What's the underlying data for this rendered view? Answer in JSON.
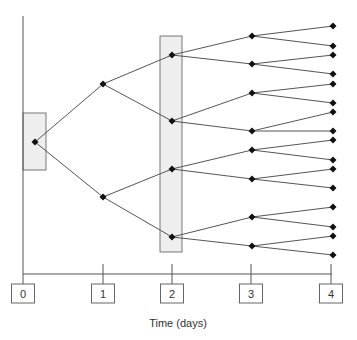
{
  "diagram": {
    "type": "binary-tree-over-time",
    "axis": {
      "xlabel": "Time (days)",
      "ticks": [
        "0",
        "1",
        "2",
        "3",
        "4"
      ]
    },
    "highlighted_stages": [
      0,
      2
    ],
    "levels": [
      {
        "day": 0,
        "nodes": 1
      },
      {
        "day": 1,
        "nodes": 2
      },
      {
        "day": 2,
        "nodes": 4
      },
      {
        "day": 3,
        "nodes": 8
      },
      {
        "day": 4,
        "nodes": 16
      }
    ],
    "colors": {
      "line": "#555555",
      "node": "#111111",
      "highlight_fill": "#eeeeee",
      "highlight_stroke": "#777777"
    }
  }
}
